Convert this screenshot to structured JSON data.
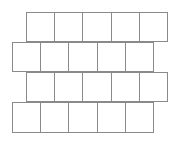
{
  "diagram": {
    "type": "offset-square-grid",
    "line_color": "#8a8a8a",
    "background": "#ffffff",
    "rows": [
      {
        "name": "row-1",
        "cells": 5,
        "offset": "right"
      },
      {
        "name": "row-2",
        "cells": 5,
        "offset": "left"
      },
      {
        "name": "row-3",
        "cells": 5,
        "offset": "right"
      },
      {
        "name": "row-4",
        "cells": 5,
        "offset": "left"
      }
    ]
  }
}
